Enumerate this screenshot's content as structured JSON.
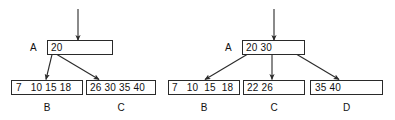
{
  "figure": {
    "background_color": "#ffffff",
    "stroke_color": "#2a2a2a",
    "text_color": "#111111",
    "diagrams": [
      {
        "id": "before-split",
        "root": {
          "pointer_label": "A",
          "keys_text": "20"
        },
        "leaves": [
          {
            "keys_text": "7   10 15 18",
            "label": "B"
          },
          {
            "keys_text": "26 30 35 40",
            "label": "C"
          }
        ]
      },
      {
        "id": "after-split",
        "root": {
          "pointer_label": "A",
          "keys_text": "20 30"
        },
        "leaves": [
          {
            "keys_text": "7   10  15  18",
            "label": "B"
          },
          {
            "keys_text": "22 26",
            "label": "C"
          },
          {
            "keys_text": "35 40",
            "label": "D"
          }
        ]
      }
    ]
  }
}
